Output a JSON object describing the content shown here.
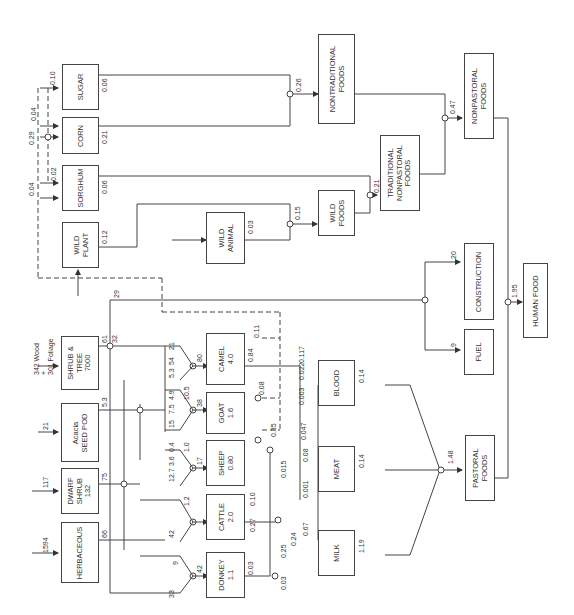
{
  "diagram": {
    "orientation": "rotated-90-ccw",
    "nodes": {
      "sugar": {
        "label": "SUGAR"
      },
      "corn": {
        "label": "CORN"
      },
      "sorghum": {
        "label": "SORGHUM"
      },
      "wild_plant": {
        "label": "WILD\nPLANT"
      },
      "wild_animal": {
        "label": "WILD\nANIMAL"
      },
      "wild_foods": {
        "label": "WILD\nFOODS"
      },
      "nontraditional_foods": {
        "label": "NONTRADITIONAL\nFOODS"
      },
      "traditional_nonpastoral_foods": {
        "label": "TRADITIONAL\nNONPASTORAL\nFOODS"
      },
      "nonpastoral_foods": {
        "label": "NONPASTORAL\nFOODS"
      },
      "shrub_tree": {
        "label": "SHRUB &\nTREE\n7000"
      },
      "acacia_seed_pod": {
        "label": "Acacia\nSEED POD"
      },
      "dwarf_shrub": {
        "label": "DWARF\nSHRUB\n132"
      },
      "herbaceous": {
        "label": "HERBACEOUS"
      },
      "camel": {
        "label": "CAMEL\n4.0"
      },
      "goat": {
        "label": "GOAT\n1.6"
      },
      "sheep": {
        "label": "SHEEP\n0.80"
      },
      "cattle": {
        "label": "CATTLE\n2.0"
      },
      "donkey": {
        "label": "DONKEY\n1.1"
      },
      "blood": {
        "label": "BLOOD"
      },
      "meat": {
        "label": "MEAT"
      },
      "milk": {
        "label": "MILK"
      },
      "pastoral_foods": {
        "label": "PASTORAL\nFOODS"
      },
      "construction": {
        "label": "CONSTRUCTION"
      },
      "fuel": {
        "label": "FUEL"
      },
      "human_food": {
        "label": "HUMAN FOOD"
      }
    },
    "inputs": {
      "shrub_tree": "342 Wood\n+\n301 Foliage",
      "acacia_seed_pod": "21",
      "dwarf_shrub": "117",
      "herbaceous": "1594"
    },
    "flows": {
      "sugar_in": "0.10",
      "corn_in_a": "0.04",
      "corn_in_b": "0.29",
      "sorghum_in_a": "0.02",
      "sorghum_in_b": "0.04",
      "sugar_out": "0.06",
      "corn_out": "0.21",
      "sorghum_out": "0.06",
      "wild_plant_out": "0.12",
      "wild_animal_out": "0.03",
      "nontraditional": "0.26",
      "wild_foods": "0.15",
      "traditional_nonpastoral": "0.21",
      "nonpastoral": "0.47",
      "human_food": "1.95",
      "pastoral": "1.48",
      "shrub_out_a": "61",
      "shrub_out_b": "32",
      "construction_flow": "29",
      "construction": "20",
      "fuel": "9",
      "camel_browse": "21",
      "camel_seed": "54",
      "camel_dwarf": "5.3",
      "camel_in": "80",
      "seed_out": "5.3",
      "goat_a": "10.5",
      "goat_b": "4.9",
      "goat_c": "7.5",
      "goat_d": "15",
      "goat_in": "38",
      "sheep_a": "1.0",
      "sheep_b": "0.4",
      "sheep_c": "3.6",
      "sheep_d": "12.7",
      "sheep_in": "17",
      "dwarf_out": "75",
      "cattle_a": "1.2",
      "cattle_b": "42",
      "herb_out": "66",
      "donkey_a": "9",
      "donkey_b": "33",
      "donkey_in": "42",
      "camel_to_nontrad": "0.11",
      "camel_out": "0.84",
      "camel_milk": "0.117",
      "camel_blood": "0.022",
      "goat_to_nontrad": "0.08",
      "goat_sheep_out": "0.35",
      "blood_a": "0.003",
      "blood_b": "0.047",
      "meat_a": "0.015",
      "meat_b": "0.08",
      "meat_c": "0.001",
      "cattle_to_nontrad": "0.10",
      "cattle_out": "0.27",
      "milk_a": "0.25",
      "milk_b": "0.24",
      "milk_c": "0.67",
      "donkey_out": "0.03",
      "milk_d": "0.03",
      "blood_out": "0.14",
      "meat_out": "0.14",
      "milk_out": "1.19"
    }
  }
}
